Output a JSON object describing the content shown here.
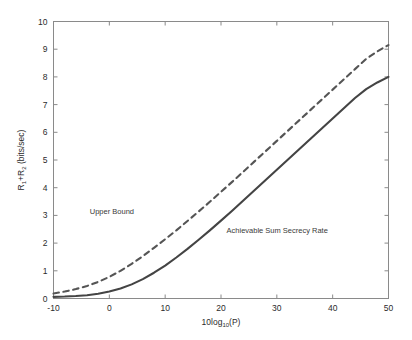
{
  "chart_data": {
    "type": "line",
    "title": "",
    "xlabel": "10log10(P)",
    "xlabel_parts": {
      "pre": "10log",
      "sub": "10",
      "post": "(P)"
    },
    "ylabel": "R1+R2 (bits/sec)",
    "ylabel_parts": {
      "r1": "R",
      "r1sub": "1",
      "plus": "+R",
      "r2sub": "2",
      "units": " (bits/sec)"
    },
    "xlim": [
      -10,
      50
    ],
    "ylim": [
      0,
      10
    ],
    "xticks": [
      -10,
      0,
      10,
      20,
      30,
      40,
      50
    ],
    "yticks": [
      0,
      1,
      2,
      3,
      4,
      5,
      6,
      7,
      8,
      9,
      10
    ],
    "xtick_labels": [
      "-10",
      "0",
      "10",
      "20",
      "30",
      "40",
      "50"
    ],
    "ytick_labels": [
      "0",
      "1",
      "2",
      "3",
      "4",
      "5",
      "6",
      "7",
      "8",
      "9",
      "10"
    ],
    "grid": false,
    "legend_position": "inline-annotations",
    "x": [
      -10,
      -8,
      -6,
      -4,
      -2,
      0,
      2,
      4,
      6,
      8,
      10,
      12,
      14,
      16,
      18,
      20,
      22,
      24,
      26,
      28,
      30,
      32,
      34,
      36,
      38,
      40,
      42,
      44,
      46,
      48,
      50
    ],
    "series": [
      {
        "name": "Upper Bound",
        "style": "dashed",
        "color": "#555555",
        "width": 2.1,
        "values": [
          0.18,
          0.25,
          0.34,
          0.45,
          0.6,
          0.78,
          1.0,
          1.25,
          1.53,
          1.83,
          2.14,
          2.46,
          2.8,
          3.14,
          3.49,
          3.85,
          4.21,
          4.58,
          4.95,
          5.32,
          5.69,
          6.06,
          6.43,
          6.8,
          7.17,
          7.54,
          7.91,
          8.28,
          8.65,
          8.92,
          9.15
        ]
      },
      {
        "name": "Achievable Sum Secrecy Rate",
        "style": "solid",
        "color": "#444444",
        "width": 2.1,
        "values": [
          0.06,
          0.07,
          0.09,
          0.12,
          0.17,
          0.25,
          0.36,
          0.51,
          0.7,
          0.93,
          1.19,
          1.48,
          1.79,
          2.12,
          2.46,
          2.81,
          3.17,
          3.54,
          3.91,
          4.28,
          4.65,
          5.02,
          5.39,
          5.76,
          6.13,
          6.5,
          6.87,
          7.24,
          7.56,
          7.8,
          8.0
        ]
      }
    ],
    "annotations": [
      {
        "text": "Upper Bound",
        "x": -3.5,
        "y": 3.05
      },
      {
        "text": "Achievable Sum Secrecy Rate",
        "x": 21.0,
        "y": 2.35
      }
    ],
    "axis_color": "#8a8a8a",
    "background_color": "#ffffff"
  }
}
